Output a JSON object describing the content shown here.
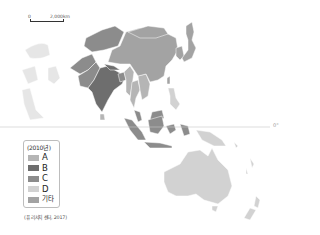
{
  "map": {
    "title": "",
    "scale_bar": {
      "start_label": "0",
      "end_label": "2,000km"
    },
    "equator_label": "0°",
    "legend": {
      "title": "(2010년)",
      "items": [
        {
          "key": "A",
          "label": "A",
          "color": "#b5b5b5"
        },
        {
          "key": "B",
          "label": "B",
          "color": "#6e6e6e"
        },
        {
          "key": "C",
          "label": "C",
          "color": "#8c8c8c"
        },
        {
          "key": "D",
          "label": "D",
          "color": "#d2d2d2"
        },
        {
          "key": "etc",
          "label": "기타",
          "color": "#a3a3a3"
        }
      ]
    },
    "source": "(퓨 리서치 센터, 2017)",
    "colors": {
      "sea": "#ffffff",
      "land_other": "#e6e6e6",
      "equator_line": "#c8c8c8",
      "border": "#ffffff"
    },
    "regions": [
      {
        "name": "china",
        "category": "etc"
      },
      {
        "name": "mongolia",
        "category": "etc"
      },
      {
        "name": "korea",
        "category": "etc"
      },
      {
        "name": "japan",
        "category": "etc"
      },
      {
        "name": "india",
        "category": "B"
      },
      {
        "name": "pakistan",
        "category": "C"
      },
      {
        "name": "afghanistan",
        "category": "C"
      },
      {
        "name": "nepal",
        "category": "B"
      },
      {
        "name": "bangladesh",
        "category": "C"
      },
      {
        "name": "sri-lanka",
        "category": "A"
      },
      {
        "name": "myanmar",
        "category": "A"
      },
      {
        "name": "thailand",
        "category": "A"
      },
      {
        "name": "indochina",
        "category": "A"
      },
      {
        "name": "malaysia",
        "category": "C"
      },
      {
        "name": "indonesia",
        "category": "C"
      },
      {
        "name": "philippines",
        "category": "D"
      },
      {
        "name": "papua-new-guinea",
        "category": "D"
      },
      {
        "name": "australia",
        "category": "D"
      },
      {
        "name": "new-zealand",
        "category": "D"
      },
      {
        "name": "central-asia",
        "category": "C"
      },
      {
        "name": "middle-east",
        "category": "other"
      }
    ]
  }
}
